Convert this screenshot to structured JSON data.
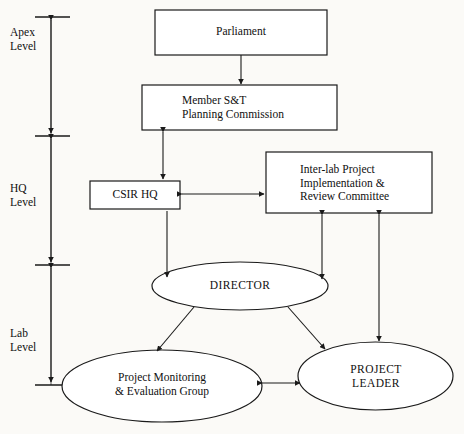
{
  "diagram": {
    "background_color": "#fbfaf7",
    "line_color": "#1a1a1a",
    "text_color": "#101010",
    "axis": {
      "name": "level-scale",
      "levels": [
        {
          "id": "apex",
          "label": "Apex\nLevel"
        },
        {
          "id": "hq",
          "label": "HQ\nLevel"
        },
        {
          "id": "lab",
          "label": "Lab\nLevel"
        }
      ]
    },
    "nodes": [
      {
        "id": "parliament",
        "shape": "rect",
        "label": "Parliament",
        "level": "apex"
      },
      {
        "id": "member-st",
        "shape": "rect",
        "label": "Member S&T\nPlanning Commission",
        "level": "apex"
      },
      {
        "id": "csir-hq",
        "shape": "rect",
        "label": "CSIR HQ",
        "level": "hq"
      },
      {
        "id": "inter-lab-committee",
        "shape": "rect",
        "label": "Inter-lab Project\nImplementation &\nReview Committee",
        "level": "hq"
      },
      {
        "id": "director",
        "shape": "ellipse",
        "label": "DIRECTOR",
        "level": "lab"
      },
      {
        "id": "project-monitoring",
        "shape": "ellipse",
        "label": "Project Monitoring\n& Evaluation Group",
        "level": "lab"
      },
      {
        "id": "project-leader",
        "shape": "ellipse",
        "label": "PROJECT\nLEADER",
        "level": "lab"
      }
    ],
    "edges": [
      {
        "from": "parliament",
        "to": "member-st",
        "arrow": "single"
      },
      {
        "from": "member-st",
        "to": "csir-hq",
        "arrow": "double"
      },
      {
        "from": "csir-hq",
        "to": "inter-lab-committee",
        "arrow": "double"
      },
      {
        "from": "csir-hq",
        "to": "director",
        "arrow": "single"
      },
      {
        "from": "inter-lab-committee",
        "to": "director",
        "arrow": "double"
      },
      {
        "from": "inter-lab-committee",
        "to": "project-leader",
        "arrow": "double"
      },
      {
        "from": "director",
        "to": "project-monitoring",
        "arrow": "single"
      },
      {
        "from": "director",
        "to": "project-leader",
        "arrow": "single"
      },
      {
        "from": "project-monitoring",
        "to": "project-leader",
        "arrow": "double"
      }
    ]
  }
}
